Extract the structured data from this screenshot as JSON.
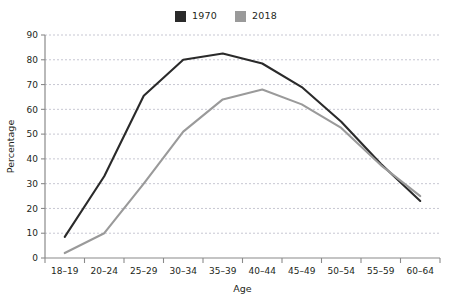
{
  "chart_data": {
    "type": "line",
    "title": "",
    "xlabel": "Age",
    "ylabel": "Percentage",
    "categories": [
      "18–19",
      "20–24",
      "25–29",
      "30–34",
      "35–39",
      "40–44",
      "45–49",
      "50–54",
      "55–59",
      "60–64"
    ],
    "yticks": [
      "0",
      "10",
      "20",
      "30",
      "40",
      "50",
      "60",
      "70",
      "80",
      "90"
    ],
    "ylim": [
      0,
      90
    ],
    "grid": true,
    "legend_position": "top-center",
    "series": [
      {
        "name": "1970",
        "color": "#2a2a2a",
        "values": [
          8.5,
          33,
          65.5,
          80,
          82.5,
          78.5,
          69,
          55,
          38,
          23
        ]
      },
      {
        "name": "2018",
        "color": "#9a9a9a",
        "values": [
          2,
          10,
          30,
          51,
          64,
          68,
          62,
          52.5,
          37.5,
          25
        ]
      }
    ]
  },
  "legend": {
    "items": [
      {
        "label": "1970",
        "color": "#2a2a2a"
      },
      {
        "label": "2018",
        "color": "#9a9a9a"
      }
    ]
  },
  "colors": {
    "series_1970": "#2a2a2a",
    "series_2018": "#9a9a9a",
    "gridline": "#b9b9c6",
    "axis": "#8a8a8a",
    "text": "#231f20",
    "background": "#ffffff"
  }
}
